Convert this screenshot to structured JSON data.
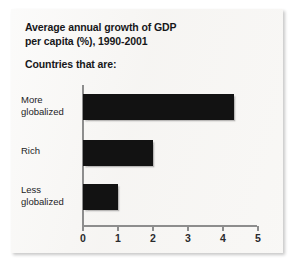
{
  "chart_data": {
    "type": "bar",
    "orientation": "horizontal",
    "title": "Average annual growth of GDP per capita (%), 1990-2001",
    "title_lines": [
      "Average annual growth of GDP",
      "per capita (%), 1990-2001"
    ],
    "subtitle": "Countries that are:",
    "categories": [
      "More globalized",
      "Rich",
      "Less globalized"
    ],
    "category_lines": [
      [
        "More",
        "globalized"
      ],
      [
        "Rich"
      ],
      [
        "Less",
        "globalized"
      ]
    ],
    "values": [
      4.3,
      2.0,
      1.0
    ],
    "xlabel": "",
    "ylabel": "",
    "xlim": [
      0,
      5
    ],
    "tick_labels": [
      "0",
      "1",
      "2",
      "3",
      "4",
      "5"
    ],
    "tick_values": [
      0,
      1,
      2,
      3,
      4,
      5
    ],
    "grid": false,
    "legend": null,
    "bar_color": "#121212",
    "axis_color": "#8d8d8d",
    "background_color": "#f7f6f4",
    "text_color": "#17171a"
  }
}
